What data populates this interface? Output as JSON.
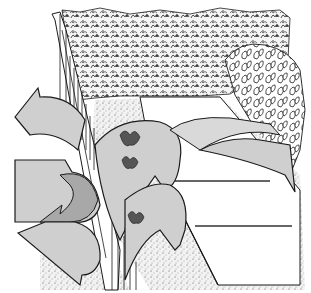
{
  "figure": {
    "colors": {
      "background": "#ffffff",
      "ink": "#1a1a1a",
      "arrow_fill": "#cfcfcf",
      "arrow_shadow": "#a8a8a8",
      "path_shade": "#d9d9d9",
      "gravel": "#e8e8e8"
    },
    "elements": [
      {
        "id": "fence",
        "label": "board fence"
      },
      {
        "id": "hedge",
        "label": "hedge"
      },
      {
        "id": "shrubs",
        "label": "leafy shrubs"
      },
      {
        "id": "path",
        "label": "paved path"
      },
      {
        "id": "gravel-bed",
        "label": "gravel bed"
      },
      {
        "id": "wind-arrows",
        "label": "wind flow arrows"
      }
    ]
  }
}
